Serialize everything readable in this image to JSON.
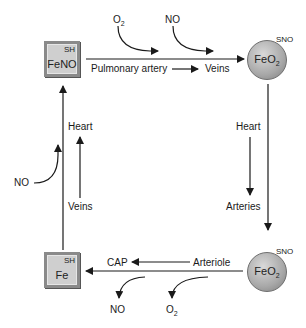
{
  "nodes": {
    "top_left_box": {
      "tag": "SH",
      "label": "FeNO"
    },
    "top_right_ball": {
      "tag": "SNO",
      "label": "FeO",
      "sub": "2"
    },
    "bottom_right_ball": {
      "tag": "SNO",
      "label": "FeO",
      "sub": "2"
    },
    "bottom_left_box": {
      "tag": "SH",
      "label": "Fe"
    }
  },
  "inputs_top": {
    "o2": {
      "label": "O",
      "sub": "2"
    },
    "no": {
      "label": "NO"
    }
  },
  "top_flow": {
    "from": "Pulmonary artery",
    "to": "Veins"
  },
  "right_flow": {
    "from": "Heart",
    "to": "Arteries"
  },
  "bottom_flow": {
    "from": "Arteriole",
    "to": "CAP"
  },
  "outputs_bottom": {
    "no": {
      "label": "NO"
    },
    "o2": {
      "label": "O",
      "sub": "2"
    }
  },
  "left_flow": {
    "from": "Veins",
    "to": "Heart"
  },
  "left_input": {
    "label": "NO"
  }
}
